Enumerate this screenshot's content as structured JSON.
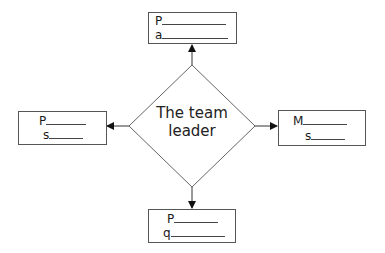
{
  "diagram": {
    "center": {
      "label_line1": "The team",
      "label_line2": "leader"
    },
    "boxes": [
      {
        "position": "top",
        "line1": "P",
        "line2": "a"
      },
      {
        "position": "left",
        "line1": "P",
        "line2": "s"
      },
      {
        "position": "right",
        "line1": "M",
        "line2": "s"
      },
      {
        "position": "bottom",
        "line1": "P",
        "line2": "q"
      }
    ],
    "colors": {
      "stroke": "#555555",
      "arrow": "#111111",
      "text": "#1a1a1a"
    }
  }
}
